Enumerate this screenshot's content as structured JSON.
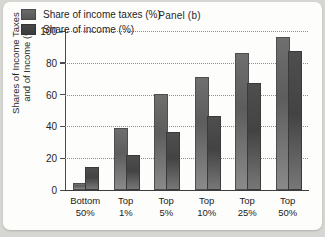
{
  "chart_data": {
    "type": "bar",
    "title": "Panel (b)",
    "xlabel": "",
    "ylabel": "Shares of Income Taxes\nand of Income (%)",
    "categories": [
      "Bottom\n50%",
      "Top\n1%",
      "Top\n5%",
      "Top\n10%",
      "Top\n25%",
      "Top\n50%"
    ],
    "series": [
      {
        "name": "Share of income taxes (%)",
        "values": [
          3,
          38,
          59,
          70,
          85,
          95
        ],
        "color": "#5d5d5d"
      },
      {
        "name": "Share of income (%)",
        "values": [
          13,
          21,
          35,
          45,
          66,
          86
        ],
        "color": "#434343"
      }
    ],
    "ylim": [
      0,
      100
    ],
    "yticks": [
      0,
      20,
      40,
      60,
      80,
      100
    ],
    "ytick_labels": [
      "0",
      "20",
      "40",
      "60",
      "80",
      "100"
    ],
    "grid": true,
    "legend_position": "top-left"
  }
}
